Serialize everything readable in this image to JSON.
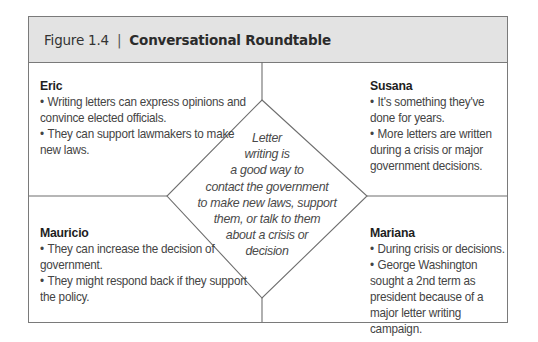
{
  "figure": {
    "label": "Figure 1.4",
    "separator": "|",
    "title": "Conversational Roundtable"
  },
  "center": {
    "lines": [
      "Letter",
      "writing is",
      "a good way to",
      "contact the government",
      "to make new laws, support",
      "them, or talk to them",
      "about a crisis or",
      "decision"
    ]
  },
  "quadrants": {
    "top_left": {
      "name": "Eric",
      "items": [
        "Writing letters can express opinions and convince elected officials.",
        "They can support lawmakers to make new laws."
      ]
    },
    "top_right": {
      "name": "Susana",
      "items": [
        "It's something they've done for years.",
        "More letters are written during a crisis or major government decisions."
      ]
    },
    "bottom_left": {
      "name": "Mauricio",
      "items": [
        "They can increase the decision of government.",
        "They might respond back if they support the policy."
      ]
    },
    "bottom_right": {
      "name": "Mariana",
      "items": [
        "During crisis or decisions.",
        "George Washington sought a 2nd term as president because of a major letter writing campaign."
      ]
    }
  },
  "colors": {
    "header_bg": "#e3e3e3",
    "border": "#7a7a7a",
    "text": "#444444"
  }
}
